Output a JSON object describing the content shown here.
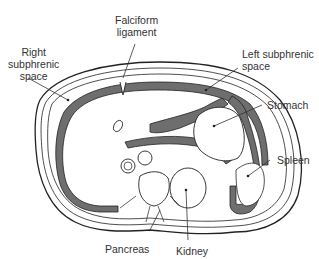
{
  "diagram": {
    "colors": {
      "outline": "#222222",
      "peritoneal_space_fill": "#6e6e6e",
      "background": "#ffffff",
      "label_text": "#333333"
    },
    "labels": {
      "falciform": "Falciform\nligament",
      "right_subphrenic": "Right\nsubphrenic\nspace",
      "left_subphrenic": "Left subphrenic\nspace",
      "stomach": "Stomach",
      "spleen": "Spleen",
      "pancreas": "Pancreas",
      "kidney": "Kidney"
    }
  }
}
